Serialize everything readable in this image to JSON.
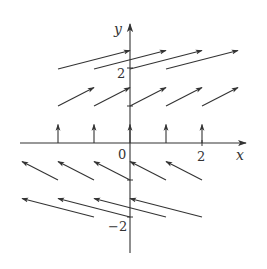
{
  "diagram": {
    "type": "vector_field",
    "axes": {
      "x_label": "x",
      "y_label": "y",
      "origin_label": "0",
      "x_tick_labels": [
        {
          "value": 2,
          "text": "2"
        }
      ],
      "y_tick_labels": [
        {
          "value": 2,
          "text": "2"
        },
        {
          "value": -2,
          "text": "−2"
        }
      ]
    },
    "colors": {
      "ink": "#333333",
      "background": "#ffffff"
    }
  },
  "chart_data": {
    "type": "vector_field",
    "title": "",
    "xlabel": "x",
    "ylabel": "y",
    "xlim": [
      -3,
      3.2
    ],
    "ylim": [
      -3,
      3.5
    ],
    "grid": false,
    "vectors": [
      {
        "x": -2,
        "y": 2,
        "dx": 2,
        "dy": 0.5
      },
      {
        "x": -1,
        "y": 2,
        "dx": 2,
        "dy": 0.5
      },
      {
        "x": 0,
        "y": 2,
        "dx": 2,
        "dy": 0.5
      },
      {
        "x": 1,
        "y": 2,
        "dx": 2,
        "dy": 0.5
      },
      {
        "x": -2,
        "y": 1,
        "dx": 1,
        "dy": 0.5
      },
      {
        "x": -1,
        "y": 1,
        "dx": 1,
        "dy": 0.5
      },
      {
        "x": 0,
        "y": 1,
        "dx": 1,
        "dy": 0.5
      },
      {
        "x": 1,
        "y": 1,
        "dx": 1,
        "dy": 0.5
      },
      {
        "x": 2,
        "y": 1,
        "dx": 1,
        "dy": 0.5
      },
      {
        "x": -2,
        "y": 0,
        "dx": 0,
        "dy": 0.5
      },
      {
        "x": -1,
        "y": 0,
        "dx": 0,
        "dy": 0.5
      },
      {
        "x": 0,
        "y": 0,
        "dx": 0,
        "dy": 0.5
      },
      {
        "x": 1,
        "y": 0,
        "dx": 0,
        "dy": 0.5
      },
      {
        "x": 2,
        "y": 0,
        "dx": 0,
        "dy": 0.5
      },
      {
        "x": -2,
        "y": -1,
        "dx": -1,
        "dy": 0.5
      },
      {
        "x": -1,
        "y": -1,
        "dx": -1,
        "dy": 0.5
      },
      {
        "x": 0,
        "y": -1,
        "dx": -1,
        "dy": 0.5
      },
      {
        "x": 1,
        "y": -1,
        "dx": -1,
        "dy": 0.5
      },
      {
        "x": 2,
        "y": -1,
        "dx": -1,
        "dy": 0.5
      },
      {
        "x": -1,
        "y": -2,
        "dx": -2,
        "dy": 0.5
      },
      {
        "x": 0,
        "y": -2,
        "dx": -2,
        "dy": 0.5
      },
      {
        "x": 1,
        "y": -2,
        "dx": -2,
        "dy": 0.5
      },
      {
        "x": 2,
        "y": -2,
        "dx": -2,
        "dy": 0.5
      }
    ]
  }
}
